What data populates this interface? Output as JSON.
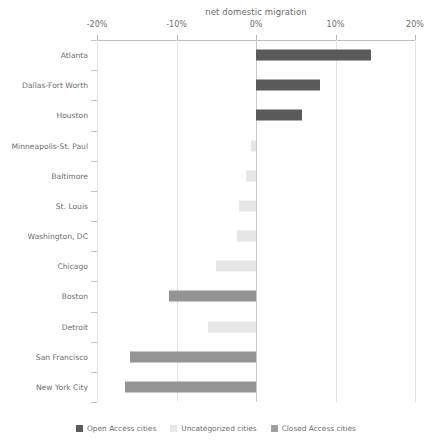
{
  "chart_data": {
    "type": "bar",
    "orientation": "horizontal",
    "title": "net domestic migration",
    "xlabel": "",
    "ylabel": "",
    "xlim": [
      -20,
      20
    ],
    "xtick_labels": [
      "-20%",
      "-10%",
      "0%",
      "10%",
      "20%"
    ],
    "xtick_values": [
      -20,
      -10,
      0,
      10,
      20
    ],
    "grid": true,
    "legend_position": "bottom",
    "unit": "%",
    "categories": [
      "Atlanta",
      "Dallas-Fort Worth",
      "Houston",
      "Minneapolis-St. Paul",
      "Baltimore",
      "St. Louis",
      "Washington, DC",
      "Chicago",
      "Boston",
      "Detroit",
      "San Francisco",
      "New York City"
    ],
    "values": [
      14.5,
      8.0,
      5.8,
      -0.6,
      -1.3,
      -2.2,
      -2.4,
      -5.0,
      -11.0,
      -6.0,
      -15.8,
      -16.5
    ],
    "groups": [
      "Closed Access cities",
      "Closed Access cities",
      "Closed Access cities",
      "Uncategorized cities",
      "Uncategorized cities",
      "Uncategorized cities",
      "Uncategorized cities",
      "Uncategorized cities",
      "Open Access cities",
      "Uncategorized cities",
      "Open Access cities",
      "Open Access cities"
    ],
    "series": [
      {
        "name": "Open Access cities",
        "color": "#949494"
      },
      {
        "name": "Uncategorized cities",
        "color": "#e6e6e6"
      },
      {
        "name": "Closed Access cities",
        "color": "#5a5a5a"
      }
    ]
  },
  "legend": {
    "items": [
      {
        "label": "Open Access cities",
        "color": "#5b5b5b"
      },
      {
        "label": "Uncategorized cities",
        "color": "#e8e8e8"
      },
      {
        "label": "Closed Access cities",
        "color": "#a0a0a0"
      }
    ]
  },
  "colors": {
    "axis": "#bdbdbd",
    "grid": "#e4e4e4",
    "zero_line": "#c9c9c9",
    "text": "#6f6f6f",
    "background": "#ffffff"
  }
}
